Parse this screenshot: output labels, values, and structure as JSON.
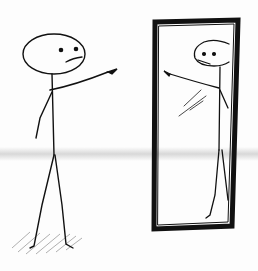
{
  "illustration": {
    "subject": "stick figure pointing at its own reflection in a standing mirror",
    "ink_color": "#111111",
    "paper_color": "#fdfdfd",
    "bleed_band_color": "#b9b9b9",
    "elements": [
      {
        "name": "stick-figure",
        "position": "left"
      },
      {
        "name": "standing-mirror",
        "position": "right"
      },
      {
        "name": "reflection-figure",
        "position": "inside mirror"
      },
      {
        "name": "floor-shadow",
        "position": "under figure"
      }
    ]
  }
}
